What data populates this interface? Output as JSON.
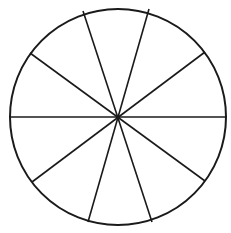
{
  "diagram": {
    "type": "circle-divided-into-sectors",
    "sector_count": 10,
    "center": [
      118,
      117
    ],
    "radius": 108,
    "stroke_color": "#1a1a1a",
    "background": "#ffffff",
    "spokes": [
      {
        "x1": 10,
        "y1": 117,
        "x2": 226,
        "y2": 117
      },
      {
        "x1": 30,
        "y1": 53,
        "x2": 205,
        "y2": 181
      },
      {
        "x1": 83,
        "y1": 11,
        "x2": 152,
        "y2": 222
      },
      {
        "x1": 149,
        "y1": 9,
        "x2": 88,
        "y2": 222
      },
      {
        "x1": 205,
        "y1": 52,
        "x2": 32,
        "y2": 182
      }
    ]
  }
}
